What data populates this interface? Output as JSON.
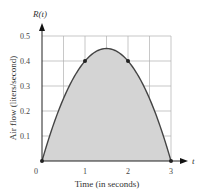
{
  "chart_data": {
    "type": "area",
    "title": "",
    "function_label": "R(t)",
    "x_axis_symbol": "t",
    "xlabel": "Time (in seconds)",
    "ylabel": "Air flow (liters/second)",
    "xlim": [
      0,
      3
    ],
    "ylim": [
      0,
      0.5
    ],
    "x_ticks": [
      "0",
      "1",
      "2",
      "3"
    ],
    "y_ticks": [
      "0.1",
      "0.2",
      "0.3",
      "0.4",
      "0.5"
    ],
    "grid": true,
    "x_grid_step": 0.5,
    "y_grid_step": 0.1,
    "curve": {
      "x": [
        0,
        0.25,
        0.5,
        0.75,
        1,
        1.25,
        1.5,
        1.75,
        2,
        2.25,
        2.5,
        2.75,
        3
      ],
      "y": [
        0,
        0.1375,
        0.25,
        0.3375,
        0.4,
        0.4375,
        0.45,
        0.4375,
        0.4,
        0.3375,
        0.25,
        0.1375,
        0
      ]
    },
    "marked_points": [
      {
        "x": 0,
        "y": 0
      },
      {
        "x": 1,
        "y": 0.4
      },
      {
        "x": 2,
        "y": 0.4
      },
      {
        "x": 3,
        "y": 0
      }
    ],
    "fill_color": "#d4d4d4",
    "curve_color": "#444444",
    "grid_color": "#b0b0b0"
  }
}
